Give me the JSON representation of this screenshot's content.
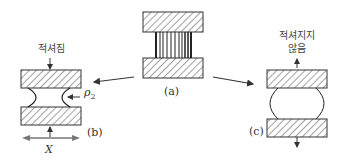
{
  "figure": {
    "panel_a": {
      "label": "(a)"
    },
    "panel_b": {
      "label": "(b)",
      "caption": "적셔짐",
      "radius_label": "ρ",
      "radius_sub": "2",
      "width_label": "X"
    },
    "panel_c": {
      "label": "(c)",
      "caption_line1": "적셔지지",
      "caption_line2": "않음"
    }
  }
}
